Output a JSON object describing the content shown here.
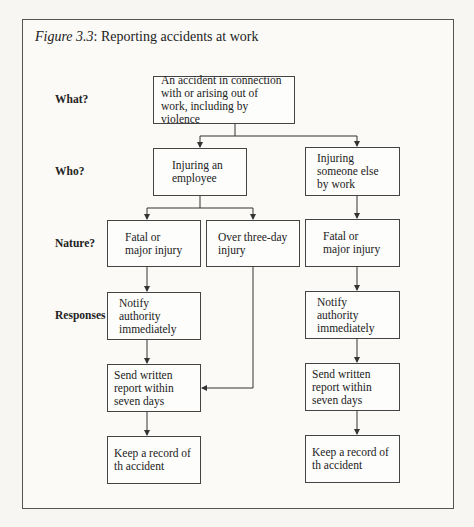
{
  "figure": {
    "label": "Figure 3.3",
    "title": ": Reporting accidents at work"
  },
  "row_labels": {
    "what": "What?",
    "who": "Who?",
    "nature": "Nature?",
    "responses": "Responses"
  },
  "nodes": {
    "accident": "An accident in connection with or arising out of work, including by violence",
    "employee": "Injuring an employee",
    "someone_else": "Injuring someone else by work",
    "emp_fatal": "Fatal or major injury",
    "emp_three_day": "Over three-day injury",
    "other_fatal": "Fatal or major injury",
    "emp_notify": "Notify authority immediately",
    "other_notify": "Notify authority immediately",
    "emp_report": "Send written report within seven days",
    "other_report": "Send written report within seven days",
    "emp_record": "Keep a record of th accident",
    "other_record": "Keep a record of th accident"
  },
  "colors": {
    "line": "#333333",
    "background": "#f7f6f3"
  }
}
